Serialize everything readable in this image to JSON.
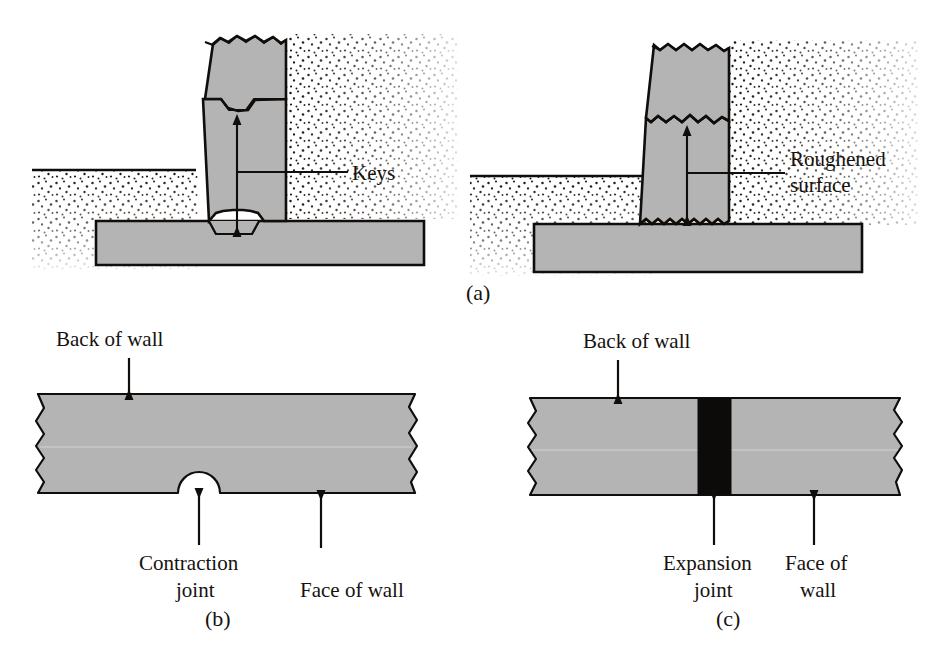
{
  "figure": {
    "background_color": "#ffffff",
    "ink_color": "#100d0b",
    "concrete_fill": "#b4b4b4",
    "joint_fill": "#0d0b0a",
    "panels": [
      {
        "id": "a-left",
        "letter": "",
        "kind": "section",
        "description": "Gravity retaining wall section with shear keys at horizontal construction joints",
        "labels": [
          {
            "name": "keys",
            "text": "Keys"
          }
        ]
      },
      {
        "id": "a-right",
        "letter": "(a)",
        "kind": "section",
        "description": "Gravity retaining wall section with roughened surfaces at horizontal construction joints",
        "labels": [
          {
            "name": "roughened-surface",
            "line1": "Roughened",
            "line2": "surface"
          }
        ]
      },
      {
        "id": "b",
        "letter": "(b)",
        "kind": "plan",
        "description": "Plan view of wall with a contraction joint groove on the face of wall",
        "labels": [
          {
            "name": "back-of-wall",
            "text": "Back of wall"
          },
          {
            "name": "contraction-joint",
            "line1": "Contraction",
            "line2": "joint"
          },
          {
            "name": "face-of-wall",
            "text": "Face of wall"
          }
        ]
      },
      {
        "id": "c",
        "letter": "(c)",
        "kind": "plan",
        "description": "Plan view of wall with a full-depth expansion joint filled with compressible filler",
        "labels": [
          {
            "name": "back-of-wall",
            "text": "Back of wall"
          },
          {
            "name": "expansion-joint",
            "line1": "Expansion",
            "line2": "joint"
          },
          {
            "name": "face-of-wall",
            "line1": "Face of",
            "line2": "wall"
          }
        ]
      }
    ]
  },
  "text": {
    "keys": "Keys",
    "roughened_line1": "Roughened",
    "roughened_line2": "surface",
    "back_of_wall": "Back of wall",
    "contraction_line1": "Contraction",
    "contraction_line2": "joint",
    "face_of_wall": "Face of wall",
    "expansion_line1": "Expansion",
    "expansion_line2": "joint",
    "face_of_line1": "Face of",
    "face_of_line2": "wall",
    "letter_a": "(a)",
    "letter_b": "(b)",
    "letter_c": "(c)"
  }
}
